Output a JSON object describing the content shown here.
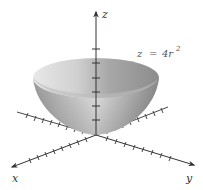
{
  "figure": {
    "equation": {
      "lhs": "z",
      "eq": "=",
      "rhs": "4r",
      "exponent": "2"
    },
    "axes": {
      "x_label": "x",
      "y_label": "y",
      "z_label": "z"
    },
    "colors": {
      "axis": "#333333",
      "surface_light": "#eeeeee",
      "surface_mid": "#b5b5b5",
      "surface_dark": "#808080",
      "inner_light": "#d9d9d9",
      "inner_dark": "#9a9a9a",
      "label": "#555555"
    },
    "z_tick_count": 6,
    "x_tick_count": 9,
    "y_tick_count": 9
  }
}
